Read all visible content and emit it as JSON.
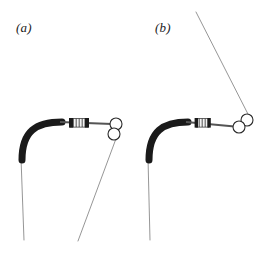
{
  "figure": {
    "type": "technical-line-diagram",
    "background_color": "#ffffff",
    "width": 263,
    "height": 259,
    "stroke_color_dark": "#1a1a1a",
    "stroke_color_thin": "#8a8a8a",
    "panels": [
      {
        "id": "a",
        "label": "(a)",
        "label_x": 16,
        "label_y": 20,
        "components": {
          "elbow": {
            "name": "curved-elbow",
            "path": "M 22 160 C 22 131, 36 122, 62 122",
            "stroke_width": 7,
            "color": "#1a1a1a"
          },
          "shaft": {
            "name": "horizontal-shaft",
            "x1": 60,
            "y1": 122,
            "x2": 112,
            "y2": 124,
            "stroke_width": 2,
            "color": "#555555"
          },
          "coupling": {
            "name": "coupling-connector",
            "x": 70,
            "y": 118,
            "width": 18,
            "height": 9,
            "cap_width": 4,
            "cap_color": "#1a1a1a",
            "body_color": "#f2f2f2",
            "hatch_color": "#606060"
          },
          "pulley": {
            "name": "pulley-assembly",
            "circles": [
              {
                "cx": 116,
                "cy": 124,
                "r": 6
              },
              {
                "cx": 114,
                "cy": 134,
                "r": 6
              }
            ],
            "stroke_width": 1.1,
            "color": "#2a2a2a"
          },
          "vertical_line": {
            "name": "vertical-cable",
            "x1": 21,
            "y1": 158,
            "x2": 24,
            "y2": 240,
            "stroke_width": 0.9,
            "color": "#8a8a8a"
          },
          "diagonal_line": {
            "name": "diagonal-cable",
            "x1": 117,
            "y1": 136,
            "x2": 78,
            "y2": 241,
            "stroke_width": 0.9,
            "color": "#8a8a8a"
          }
        }
      },
      {
        "id": "b",
        "label": "(b)",
        "label_x": 155,
        "label_y": 20,
        "components": {
          "elbow": {
            "name": "curved-elbow",
            "path": "M 149 160 C 149 131, 163 122, 188 122",
            "stroke_width": 7,
            "color": "#1a1a1a"
          },
          "shaft": {
            "name": "horizontal-shaft",
            "x1": 186,
            "y1": 122,
            "x2": 240,
            "y2": 127,
            "stroke_width": 2,
            "color": "#555555"
          },
          "coupling": {
            "name": "coupling-connector",
            "x": 196,
            "y": 118,
            "width": 13,
            "height": 9,
            "cap_width": 3,
            "cap_color": "#1a1a1a",
            "body_color": "#f2f2f2",
            "hatch_color": "#606060"
          },
          "pulley": {
            "name": "pulley-assembly",
            "circles": [
              {
                "cx": 247,
                "cy": 120,
                "r": 6
              },
              {
                "cx": 239,
                "cy": 127,
                "r": 6
              }
            ],
            "stroke_width": 1.1,
            "color": "#2a2a2a"
          },
          "vertical_line": {
            "name": "vertical-cable",
            "x1": 148,
            "y1": 158,
            "x2": 150,
            "y2": 240,
            "stroke_width": 0.9,
            "color": "#8a8a8a"
          },
          "diagonal_line": {
            "name": "diagonal-cable",
            "x1": 250,
            "y1": 118,
            "x2": 196,
            "y2": 12,
            "stroke_width": 0.9,
            "color": "#8a8a8a"
          }
        }
      }
    ]
  }
}
